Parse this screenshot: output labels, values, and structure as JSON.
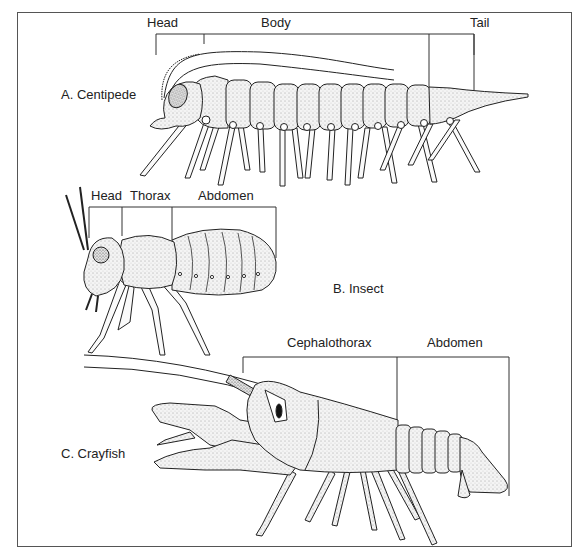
{
  "figure": {
    "panels": [
      {
        "id": "A",
        "name": "A.  Centipede",
        "segments": [
          {
            "label": "Head"
          },
          {
            "label": "Body"
          },
          {
            "label": "Tail"
          }
        ]
      },
      {
        "id": "B",
        "name": "B.  Insect",
        "segments": [
          {
            "label": "Head"
          },
          {
            "label": "Thorax"
          },
          {
            "label": "Abdomen"
          }
        ]
      },
      {
        "id": "C",
        "name": "C.  Crayfish",
        "segments": [
          {
            "label": "Cephalothorax"
          },
          {
            "label": "Abdomen"
          }
        ]
      }
    ]
  }
}
